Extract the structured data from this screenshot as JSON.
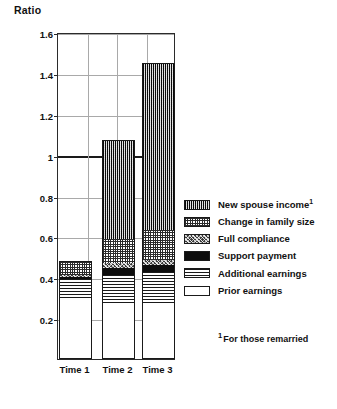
{
  "chart_data": {
    "type": "bar",
    "subtype": "stacked-bar",
    "title": "",
    "ylabel": "Ratio",
    "xlabel": "",
    "categories": [
      "Time 1",
      "Time 2",
      "Time 3"
    ],
    "ylim": [
      0,
      1.6
    ],
    "ytick_labels": [
      "0.2",
      "0.4",
      "0.6",
      "0.8",
      "1",
      "1.2",
      "1.4",
      "1.6"
    ],
    "ytick_values": [
      0.2,
      0.4,
      0.6,
      0.8,
      1.0,
      1.2,
      1.4,
      1.6
    ],
    "grid": true,
    "legend_position": "right",
    "reference_line": {
      "value": 1.0,
      "label": ""
    },
    "series": [
      {
        "name": "Prior earnings",
        "pattern": "white",
        "values": [
          0.29,
          0.275,
          0.27
        ]
      },
      {
        "name": "Additional earnings",
        "pattern": "horizontal-lines",
        "values": [
          0.1,
          0.135,
          0.155
        ]
      },
      {
        "name": "Support payment",
        "pattern": "solid-black",
        "values": [
          0.01,
          0.035,
          0.035
        ]
      },
      {
        "name": "Full compliance",
        "pattern": "dark-speckle",
        "values": [
          0.01,
          0.025,
          0.025
        ]
      },
      {
        "name": "Change in family size",
        "pattern": "light-crosshatch",
        "values": [
          0.07,
          0.115,
          0.145
        ]
      },
      {
        "name": "New spouse income",
        "pattern": "dense-crosshatch",
        "values": [
          0.0,
          0.485,
          0.82
        ]
      }
    ],
    "totals": [
      0.48,
      1.07,
      1.45
    ],
    "cumulative_tops": [
      [
        0.29,
        0.39,
        0.4,
        0.41,
        0.48,
        0.48
      ],
      [
        0.275,
        0.41,
        0.445,
        0.47,
        0.585,
        1.07
      ],
      [
        0.27,
        0.425,
        0.46,
        0.485,
        0.63,
        1.45
      ]
    ]
  },
  "axis": {
    "y_title": "Ratio",
    "ticks": [
      "1.6",
      "1.4",
      "1.2",
      "1",
      "0.8",
      "0.6",
      "0.4",
      "0.2"
    ]
  },
  "x_labels": [
    "Time 1",
    "Time 2",
    "Time 3"
  ],
  "legend": {
    "items": [
      {
        "label": "New spouse income",
        "superscript": "1"
      },
      {
        "label": "Change in family size",
        "superscript": ""
      },
      {
        "label": "Full compliance",
        "superscript": ""
      },
      {
        "label": "Support payment",
        "superscript": ""
      },
      {
        "label": "Additional earnings",
        "superscript": ""
      },
      {
        "label": "Prior earnings",
        "superscript": ""
      }
    ]
  },
  "footnote": {
    "marker": "1",
    "text": "For those remarried"
  },
  "colors": {
    "ink": "#1a1a1a",
    "grid": "#a9a9a9",
    "reference_line": "#1a1a1a",
    "background": "#ffffff"
  }
}
